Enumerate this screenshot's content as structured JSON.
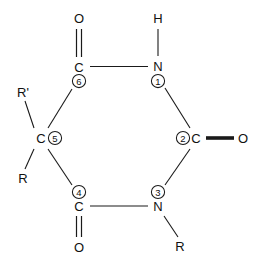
{
  "diagram": {
    "type": "chemical-structure",
    "line_color": "#1a1a1a",
    "text_color": "#111111",
    "background": "#ffffff",
    "ring_atoms": [
      {
        "id": "n1",
        "element": "N",
        "number": "1",
        "x": 158,
        "y": 66,
        "num_x": 158,
        "num_y": 81,
        "num_pos": "below"
      },
      {
        "id": "c2",
        "element": "C",
        "number": "2",
        "x": 196,
        "y": 138,
        "num_x": 183,
        "num_y": 138,
        "num_pos": "left"
      },
      {
        "id": "n3",
        "element": "N",
        "number": "3",
        "x": 158,
        "y": 206,
        "num_x": 158,
        "num_y": 192,
        "num_pos": "above"
      },
      {
        "id": "c4",
        "element": "C",
        "number": "4",
        "x": 79,
        "y": 206,
        "num_x": 79,
        "num_y": 192,
        "num_pos": "above"
      },
      {
        "id": "c5",
        "element": "C",
        "number": "5",
        "x": 41,
        "y": 138,
        "num_x": 55,
        "num_y": 138,
        "num_pos": "right"
      },
      {
        "id": "c6",
        "element": "C",
        "number": "6",
        "x": 79,
        "y": 67,
        "num_x": 79,
        "num_y": 81,
        "num_pos": "below"
      }
    ],
    "substituents": [
      {
        "id": "o-top",
        "label": "O",
        "x": 79,
        "y": 18,
        "attached_to": "c6",
        "bond": "double"
      },
      {
        "id": "h-top",
        "label": "H",
        "x": 158,
        "y": 18,
        "attached_to": "n1",
        "bond": "single"
      },
      {
        "id": "o-right",
        "label": "O",
        "x": 243,
        "y": 138,
        "attached_to": "c2",
        "bond": "double"
      },
      {
        "id": "r-bottom",
        "label": "R",
        "x": 180,
        "y": 246,
        "attached_to": "n3",
        "bond": "single"
      },
      {
        "id": "o-bottom",
        "label": "O",
        "x": 79,
        "y": 247,
        "attached_to": "c4",
        "bond": "double"
      },
      {
        "id": "r-lower-left",
        "label": "R",
        "x": 23,
        "y": 178,
        "attached_to": "c5",
        "bond": "single"
      },
      {
        "id": "r-prime",
        "label": "R'",
        "x": 23,
        "y": 92,
        "attached_to": "c5",
        "bond": "single"
      }
    ],
    "ring_bonds": [
      {
        "from": "n1",
        "to": "c2"
      },
      {
        "from": "c2",
        "to": "n3"
      },
      {
        "from": "n3",
        "to": "c4"
      },
      {
        "from": "c4",
        "to": "c5"
      },
      {
        "from": "c5",
        "to": "c6"
      },
      {
        "from": "c6",
        "to": "n1"
      }
    ]
  }
}
